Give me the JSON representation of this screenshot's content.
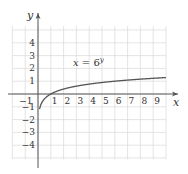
{
  "chart_data": {
    "type": "line",
    "title": "",
    "xlabel": "x",
    "ylabel": "y",
    "xlim": [
      -1,
      10
    ],
    "ylim": [
      -5,
      5
    ],
    "grid": true,
    "x_ticks": [
      "-1",
      "1",
      "2",
      "3",
      "4",
      "5",
      "6",
      "7",
      "8",
      "9"
    ],
    "y_ticks": [
      "4",
      "3",
      "2",
      "1",
      "-1",
      "-2",
      "-3",
      "-4"
    ],
    "series": [
      {
        "name": "x = 6^y",
        "equation": "x = 6^y",
        "description": "y = log base 6 of x",
        "x": [
          0.12,
          0.2,
          0.3,
          0.5,
          1,
          2,
          3,
          4,
          5,
          6,
          7,
          8,
          9,
          10
        ],
        "y": [
          -1.18,
          -0.9,
          -0.67,
          -0.39,
          0,
          0.39,
          0.61,
          0.77,
          0.9,
          1.0,
          1.09,
          1.16,
          1.23,
          1.29
        ]
      }
    ],
    "annotations": [
      {
        "text": "x = 6^y",
        "x": 4.2,
        "y": 2.1
      }
    ],
    "colors": {
      "curve": "#555555",
      "axis": "#555555",
      "grid": "#d9d9d9"
    }
  },
  "labels": {
    "x_axis": "x",
    "y_axis": "y",
    "equation_lhs": "x",
    "equation_eq": " = 6",
    "equation_exp": "y"
  }
}
